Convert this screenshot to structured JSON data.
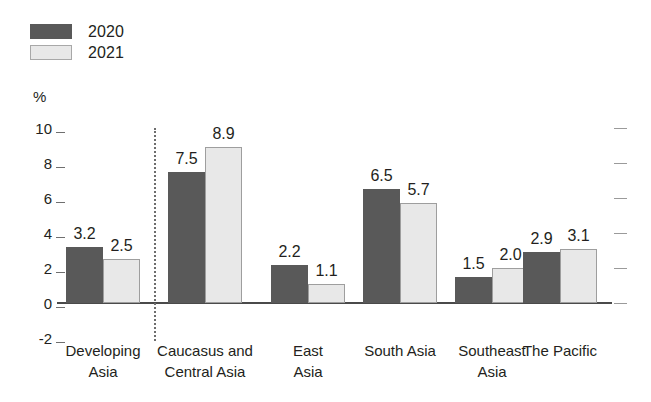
{
  "chart_data": {
    "type": "bar",
    "title": "",
    "subtitle": "",
    "xlabel": "",
    "ylabel": "%",
    "ylim": [
      -2,
      10
    ],
    "ytick_values": [
      10,
      8,
      6,
      4,
      2,
      0,
      -2
    ],
    "ytick_labels": [
      "10",
      "8",
      "6",
      "4",
      "2",
      "0",
      "-2"
    ],
    "grid": false,
    "legend_position": "top-left",
    "categories": [
      "Developing\nAsia",
      "Caucasus and\nCentral Asia",
      "East\nAsia",
      "South Asia",
      "Southeast\nAsia",
      "The Pacific"
    ],
    "series": [
      {
        "name": "2020",
        "color": "#595959",
        "values": [
          3.2,
          7.5,
          2.2,
          6.5,
          1.5,
          2.9
        ]
      },
      {
        "name": "2021",
        "color": "#e8e8e8",
        "values": [
          2.5,
          8.9,
          1.1,
          5.7,
          2.0,
          3.1
        ]
      }
    ],
    "value_labels": [
      [
        "3.2",
        "2.5"
      ],
      [
        "7.5",
        "8.9"
      ],
      [
        "2.2",
        "1.1"
      ],
      [
        "6.5",
        "5.7"
      ],
      [
        "1.5",
        "2.0"
      ],
      [
        "2.9",
        "3.1"
      ]
    ],
    "annotations": [
      {
        "type": "vertical-dotted-separator",
        "after_category_index": 0
      }
    ]
  },
  "legend": {
    "items": [
      {
        "label": "2020",
        "swatch": "dark-gray-swatch"
      },
      {
        "label": "2021",
        "swatch": "light-gray-swatch"
      }
    ]
  },
  "axis": {
    "unit_label": "%"
  },
  "colors": {
    "series_2020": "#595959",
    "series_2021": "#e8e8e8",
    "series_2021_border": "#9e9e9e",
    "axis_line": "#4a4a4a",
    "tick_left": "#6f6f6f",
    "tick_right": "#9a9a9a",
    "separator": "#6d6d6d",
    "text": "#231f20",
    "background": "#ffffff"
  }
}
